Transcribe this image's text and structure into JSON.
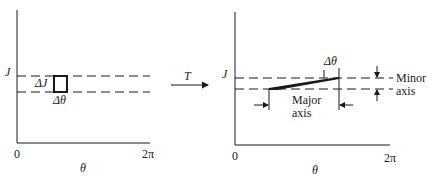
{
  "left_panel": {
    "y_label": "J",
    "x_label": "θ",
    "x_start": "0",
    "x_end": "2π",
    "cell_height_label": "ΔJ",
    "cell_width_label": "Δθ"
  },
  "transform": {
    "label": "T"
  },
  "right_panel": {
    "y_label": "J",
    "x_label": "θ",
    "x_start": "0",
    "x_end": "2π",
    "cell_width_label": "Δθ",
    "major_axis_label_line1": "Major",
    "major_axis_label_line2": "axis",
    "minor_axis_label_line1": "Minor",
    "minor_axis_label_line2": "axis"
  },
  "colors": {
    "ink": "#1a1a1a",
    "background": "#ffffff"
  }
}
